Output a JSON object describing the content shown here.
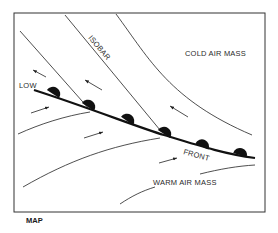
{
  "diagram": {
    "caption": "MAP",
    "labels": {
      "cold_air_mass": "COLD AIR MASS",
      "warm_air_mass": "WARM AIR MASS",
      "isobar": "ISOBAR",
      "low": "LOW",
      "front": "FRONT"
    },
    "front_type": "warm-front-semicircles",
    "colors": {
      "ink": "#1a1a1a",
      "background": "#ffffff"
    }
  }
}
